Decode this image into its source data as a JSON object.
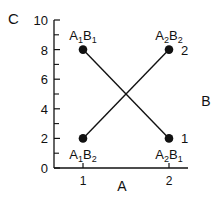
{
  "chart_data": {
    "type": "line",
    "title": "",
    "xlabel": "A",
    "ylabel": "C",
    "legend_title": "B",
    "xlim": [
      0.62,
      2.25
    ],
    "ylim": [
      0,
      10
    ],
    "x_ticks": [
      1,
      2
    ],
    "x_tick_labels": [
      "1",
      "2"
    ],
    "y_ticks": [
      0,
      2,
      4,
      6,
      8,
      10
    ],
    "y_tick_labels": [
      "0",
      "2",
      "4",
      "6",
      "8",
      "10"
    ],
    "y_minor_ticks": [
      1,
      3,
      5,
      7,
      9
    ],
    "grid": false,
    "x": [
      1,
      2
    ],
    "series": [
      {
        "name": "1",
        "values": [
          8,
          2
        ],
        "point_labels": [
          [
            "A",
            "1",
            "B",
            "1"
          ],
          [
            "A",
            "2",
            "B",
            "1"
          ]
        ],
        "label_positions": [
          "above",
          "below"
        ]
      },
      {
        "name": "2",
        "values": [
          2,
          8
        ],
        "point_labels": [
          [
            "A",
            "1",
            "B",
            "2"
          ],
          [
            "A",
            "2",
            "B",
            "2"
          ]
        ],
        "label_positions": [
          "below",
          "above"
        ]
      }
    ],
    "colors": {
      "ink": "#111111"
    }
  }
}
